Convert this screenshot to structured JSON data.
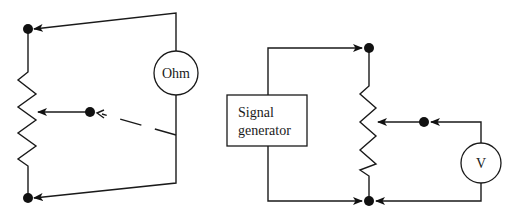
{
  "diagram": {
    "left_circuit": {
      "meter_label": "Ohm",
      "description": "Ohmmeter across potentiometer ends, movable lead to wiper"
    },
    "right_circuit": {
      "source_label_line1": "Signal",
      "source_label_line2": "generator",
      "meter_label": "V",
      "description": "Signal generator across potentiometer, voltmeter between wiper and bottom terminal"
    },
    "colors": {
      "line": "#1a1a1a",
      "background": "#ffffff"
    }
  }
}
